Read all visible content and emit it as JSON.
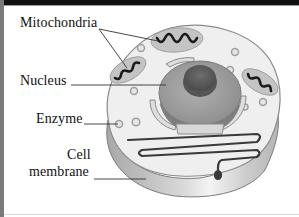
{
  "diagram": {
    "type": "labeled-illustration",
    "labels": {
      "mitochondria": "Mitochondria",
      "nucleus": "Nucleus",
      "enzyme": "Enzyme",
      "cell_line1": "Cell",
      "cell_line2": "membrane"
    },
    "colors": {
      "frame_left": "#7a7a7a",
      "frame_top": "#111111",
      "cytoplasm": "#efefef",
      "membrane": "#bdbdbd",
      "nucleus": "#9a9a9a",
      "nucleolus": "#5e5e5e",
      "leader_line": "#444444"
    }
  }
}
